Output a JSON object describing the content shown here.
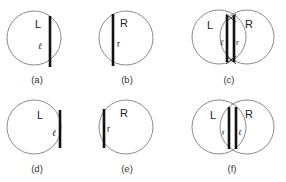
{
  "figure": {
    "panels": [
      {
        "id": "a",
        "caption": "(a)",
        "region_label": "L",
        "segment_label": "ℓ"
      },
      {
        "id": "b",
        "caption": "(b)",
        "region_label": "R",
        "segment_label": "r"
      },
      {
        "id": "c",
        "caption": "(c)",
        "region_labels": [
          "L",
          "R"
        ],
        "segment_labels": [
          "ℓ",
          "r"
        ]
      },
      {
        "id": "d",
        "caption": "(d)",
        "region_label": "L",
        "segment_label": "ℓ"
      },
      {
        "id": "e",
        "caption": "(e)",
        "region_label": "R",
        "segment_label": "r"
      },
      {
        "id": "f",
        "caption": "(f)",
        "region_labels": [
          "L",
          "R"
        ],
        "segment_labels": [
          "r",
          "ℓ"
        ]
      }
    ]
  }
}
